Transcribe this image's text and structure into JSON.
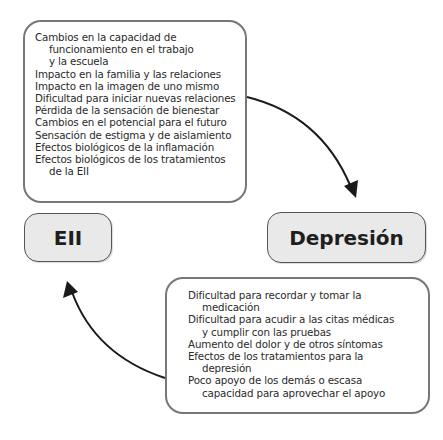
{
  "top_box": {
    "items": [
      {
        "text": "Cambios en la capacidad de",
        "continuations": [
          "funcionamiento en el trabajo",
          "y la escuela"
        ]
      },
      {
        "text": "Impacto en la familia y las relaciones",
        "continuations": []
      },
      {
        "text": "Impacto en la imagen de uno mismo",
        "continuations": []
      },
      {
        "text": "Dificultad para iniciar nuevas relaciones",
        "continuations": []
      },
      {
        "text": "Pérdida de la sensación de bienestar",
        "continuations": []
      },
      {
        "text": "Cambios en el potencial para el futuro",
        "continuations": []
      },
      {
        "text": "Sensación de estigma y de aislamiento",
        "continuations": []
      },
      {
        "text": "Efectos biológicos de la inflamación",
        "continuations": []
      },
      {
        "text": "Efectos biológicos de los tratamientos",
        "continuations": [
          "de la EII"
        ]
      }
    ]
  },
  "nodes": {
    "left": "EII",
    "right": "Depresión"
  },
  "bottom_box": {
    "items": [
      {
        "text": "Dificultad para recordar y tomar la",
        "continuations": [
          "medicación"
        ]
      },
      {
        "text": "Dificultad para acudir a las citas médicas",
        "continuations": [
          "y cumplir con las pruebas"
        ]
      },
      {
        "text": "Aumento del dolor y de otros síntomas",
        "continuations": []
      },
      {
        "text": "Efectos de los tratamientos para la",
        "continuations": [
          "depresión"
        ]
      },
      {
        "text": "Poco apoyo de los demás o escasa",
        "continuations": [
          "capacidad para aprovechar el apoyo"
        ]
      }
    ]
  },
  "colors": {
    "box_border": "#777777",
    "node_fill": "#e9e9e9",
    "arrow": "#1a1a1a"
  }
}
